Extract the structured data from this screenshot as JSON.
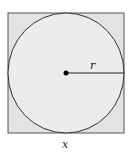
{
  "diagram": {
    "type": "circle inscribed in square",
    "square": {
      "fill": "#e3e3e3",
      "stroke": "#555555",
      "side_label": "x"
    },
    "circle": {
      "fill": "#ececec",
      "stroke": "#333333",
      "radius_label": "r"
    },
    "center_point": {
      "fill": "#000000"
    },
    "labels": {
      "radius": "r",
      "side": "x"
    }
  }
}
